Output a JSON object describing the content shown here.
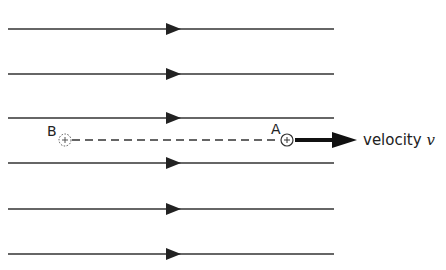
{
  "diagram": {
    "type": "field-lines-with-moving-charges",
    "field_lines": {
      "count": 6,
      "y_positions": [
        29,
        74,
        118,
        163,
        209,
        254
      ],
      "x_start": 8,
      "x_end": 334,
      "arrow_x": 170,
      "direction": "right",
      "color": "#222222"
    },
    "points": {
      "B": {
        "label": "B",
        "x": 65,
        "y": 140,
        "symbol": "⊕",
        "style": "dotted circle with plus"
      },
      "A": {
        "label": "A",
        "x": 287,
        "y": 140,
        "symbol": "⊕",
        "style": "solid circle with plus"
      }
    },
    "dashed_line": {
      "from": "B",
      "to": "A",
      "y": 140
    },
    "velocity_arrow": {
      "x_start": 295,
      "x_end": 356,
      "y": 140,
      "label_prefix": "velocity ",
      "label_symbol": "v"
    }
  }
}
